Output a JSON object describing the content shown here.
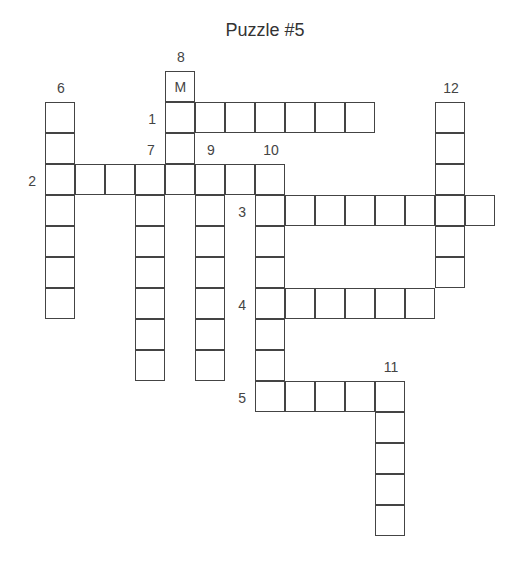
{
  "title": "Puzzle #5",
  "grid": {
    "origin_x": 46,
    "origin_y": 72,
    "cell_w": 30,
    "cell_h": 31
  },
  "entries": [
    {
      "number": "1",
      "direction": "across",
      "col": 4,
      "row": 1,
      "length": 7,
      "label_pos": "left"
    },
    {
      "number": "2",
      "direction": "across",
      "col": 0,
      "row": 3,
      "length": 8,
      "label_pos": "left"
    },
    {
      "number": "3",
      "direction": "across",
      "col": 7,
      "row": 4,
      "length": 8,
      "label_pos": "left"
    },
    {
      "number": "4",
      "direction": "across",
      "col": 7,
      "row": 7,
      "length": 6,
      "label_pos": "left"
    },
    {
      "number": "5",
      "direction": "across",
      "col": 7,
      "row": 10,
      "length": 5,
      "label_pos": "left"
    },
    {
      "number": "6",
      "direction": "down",
      "col": 0,
      "row": 1,
      "length": 7,
      "label_pos": "top"
    },
    {
      "number": "7",
      "direction": "down",
      "col": 3,
      "row": 3,
      "length": 7,
      "label_pos": "top"
    },
    {
      "number": "8",
      "direction": "down",
      "col": 4,
      "row": 0,
      "length": 4,
      "label_pos": "top"
    },
    {
      "number": "9",
      "direction": "down",
      "col": 5,
      "row": 3,
      "length": 7,
      "label_pos": "top"
    },
    {
      "number": "10",
      "direction": "down",
      "col": 7,
      "row": 3,
      "length": 8,
      "label_pos": "top"
    },
    {
      "number": "11",
      "direction": "down",
      "col": 11,
      "row": 10,
      "length": 5,
      "label_pos": "top"
    },
    {
      "number": "12",
      "direction": "down",
      "col": 13,
      "row": 1,
      "length": 6,
      "label_pos": "top"
    }
  ],
  "filled_letters": [
    {
      "col": 4,
      "row": 0,
      "letter": "M"
    }
  ]
}
